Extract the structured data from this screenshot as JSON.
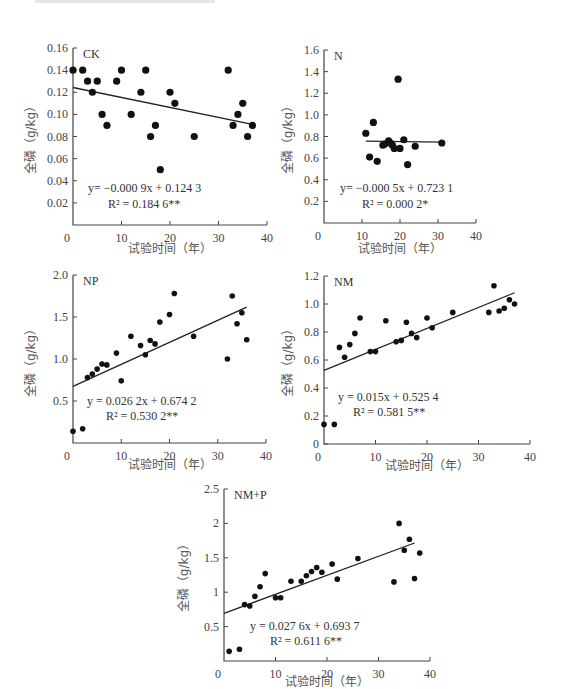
{
  "chart_data": [
    {
      "type": "scatter",
      "panel": "CK",
      "xlabel": "试验时间（年）",
      "ylabel": "全磷（g/kg）",
      "xlim": [
        0,
        40
      ],
      "ylim": [
        0,
        0.16
      ],
      "xticks": [
        0,
        10,
        20,
        30,
        40
      ],
      "yticks": [
        0.02,
        0.04,
        0.06,
        0.08,
        0.1,
        0.12,
        0.14,
        0.16
      ],
      "ytick_labels": [
        "0.02",
        "0.04",
        "0.06",
        "0.08",
        "0.10",
        "0.12",
        "0.14",
        "0.16"
      ],
      "x": [
        0,
        2,
        3,
        4,
        5,
        6,
        7,
        9,
        10,
        12,
        14,
        15,
        16,
        17,
        18,
        20,
        21,
        25,
        32,
        33,
        34,
        35,
        36,
        37
      ],
      "y": [
        0.14,
        0.14,
        0.13,
        0.12,
        0.13,
        0.1,
        0.09,
        0.13,
        0.14,
        0.1,
        0.12,
        0.14,
        0.08,
        0.09,
        0.05,
        0.12,
        0.11,
        0.08,
        0.14,
        0.09,
        0.1,
        0.11,
        0.08,
        0.09
      ],
      "fit": {
        "slope": -0.0009,
        "intercept": 0.1243,
        "x_range": [
          0,
          37
        ]
      },
      "equation": "y= −0.000 9x + 0.124 3",
      "r2": "R² = 0.184 6**"
    },
    {
      "type": "scatter",
      "panel": "N",
      "xlabel": "试验时间（年）",
      "ylabel": "全磷（g/kg）",
      "xlim": [
        0,
        40
      ],
      "ylim": [
        0,
        1.6
      ],
      "xticks": [
        0,
        10,
        20,
        30,
        40
      ],
      "yticks": [
        0.2,
        0.4,
        0.6,
        0.8,
        1.0,
        1.2,
        1.4,
        1.6
      ],
      "ytick_labels": [
        "0.2",
        "0.4",
        "0.6",
        "0.8",
        "1.0",
        "1.2",
        "1.4",
        "1.6"
      ],
      "x": [
        11,
        12,
        13,
        14,
        15.5,
        16,
        17,
        17.5,
        18,
        18.5,
        19.5,
        20,
        21,
        22,
        24,
        31
      ],
      "y": [
        0.83,
        0.61,
        0.93,
        0.57,
        0.72,
        0.73,
        0.76,
        0.74,
        0.72,
        0.69,
        1.33,
        0.69,
        0.77,
        0.54,
        0.71,
        0.74
      ],
      "fit": {
        "slope": -0.0005,
        "intercept": 0.7631,
        "x_range": [
          11,
          31
        ]
      },
      "equation": "y= −0.000 5x + 0.723 1",
      "r2": "R² = 0.000 2*"
    },
    {
      "type": "scatter",
      "panel": "NP",
      "xlabel": "试验时间（年）",
      "ylabel": "全磷（g/kg）",
      "xlim": [
        0,
        40
      ],
      "ylim": [
        0,
        2.0
      ],
      "xticks": [
        0,
        10,
        20,
        30,
        40
      ],
      "yticks": [
        0.5,
        1.0,
        1.5,
        2.0
      ],
      "ytick_labels": [
        "0.5",
        "1.0",
        "1.5",
        "2.0"
      ],
      "x": [
        0,
        2,
        3,
        4,
        5,
        6,
        7,
        9,
        10,
        12,
        14,
        15,
        16,
        17,
        18,
        20,
        21,
        25,
        32,
        33,
        34,
        35,
        36
      ],
      "y": [
        0.14,
        0.17,
        0.78,
        0.82,
        0.88,
        0.94,
        0.93,
        1.07,
        0.74,
        1.27,
        1.16,
        1.05,
        1.22,
        1.18,
        1.44,
        1.53,
        1.78,
        1.27,
        1.0,
        1.75,
        1.42,
        1.55,
        1.23
      ],
      "fit": {
        "slope": 0.0262,
        "intercept": 0.6742,
        "x_range": [
          0,
          36
        ]
      },
      "equation": "y = 0.026 2x + 0.674 2",
      "r2": "R² = 0.530 2**"
    },
    {
      "type": "scatter",
      "panel": "NM",
      "xlabel": "试验时间（年）",
      "ylabel": "全磷（g/kg）",
      "xlim": [
        0,
        40
      ],
      "ylim": [
        0,
        1.2
      ],
      "xticks": [
        0,
        10,
        20,
        30,
        40
      ],
      "yticks": [
        0,
        0.2,
        0.4,
        0.6,
        0.8,
        1.0,
        1.2
      ],
      "ytick_labels": [
        "0",
        "0.2",
        "0.4",
        "0.6",
        "0.8",
        "1.0",
        "1.2"
      ],
      "x": [
        0,
        2,
        3,
        4,
        5,
        6,
        7,
        9,
        10,
        12,
        14,
        15,
        16,
        17,
        18,
        20,
        21,
        25,
        32,
        33,
        34,
        35,
        36,
        37
      ],
      "y": [
        0.14,
        0.14,
        0.69,
        0.62,
        0.71,
        0.79,
        0.9,
        0.66,
        0.66,
        0.88,
        0.73,
        0.74,
        0.87,
        0.79,
        0.76,
        0.9,
        0.83,
        0.94,
        0.94,
        1.13,
        0.95,
        0.97,
        1.03,
        1.0
      ],
      "fit": {
        "slope": 0.015,
        "intercept": 0.5254,
        "x_range": [
          0,
          37
        ]
      },
      "equation": "y = 0.015x + 0.525 4",
      "r2": "R² = 0.581 5**"
    },
    {
      "type": "scatter",
      "panel": "NM+P",
      "xlabel": "试验时间（年）",
      "ylabel": "全磷（g/kg）",
      "xlim": [
        0,
        40
      ],
      "ylim": [
        0,
        2.5
      ],
      "xticks": [
        0,
        10,
        20,
        30,
        40
      ],
      "yticks": [
        0.5,
        1,
        1.5,
        2,
        2.5
      ],
      "ytick_labels": [
        "0.5",
        "1",
        "1.5",
        "2",
        "2.5"
      ],
      "x": [
        1,
        3,
        4,
        5,
        6,
        7,
        8,
        10,
        11,
        13,
        15,
        16,
        17,
        18,
        19,
        21,
        22,
        26,
        33,
        34,
        35,
        36,
        37,
        38
      ],
      "y": [
        0.14,
        0.17,
        0.82,
        0.8,
        0.94,
        1.08,
        1.27,
        0.92,
        0.92,
        1.16,
        1.16,
        1.24,
        1.3,
        1.36,
        1.29,
        1.41,
        1.19,
        1.49,
        1.15,
        2.0,
        1.61,
        1.77,
        1.2,
        1.57
      ],
      "fit": {
        "slope": 0.0276,
        "intercept": 0.6937,
        "x_range": [
          0,
          37
        ]
      },
      "equation": "y = 0.027 6x + 0.693 7",
      "r2": "R² = 0.611 6**"
    }
  ],
  "layout": {
    "panels": [
      {
        "x0": 73,
        "xEnd": 267,
        "yTop": 48,
        "yBase": 225,
        "eqX": 88,
        "eqY": 192,
        "r2X": 108,
        "r2Y": 208,
        "ylabelX": 35,
        "ylabelY": 137,
        "xlabelX": 170,
        "xlabelY": 253
      },
      {
        "x0": 324,
        "xEnd": 476,
        "yTop": 50,
        "yBase": 223,
        "eqX": 340,
        "eqY": 192,
        "r2X": 362,
        "r2Y": 208,
        "ylabelX": 292,
        "ylabelY": 137,
        "xlabelX": 400,
        "xlabelY": 253
      },
      {
        "x0": 73,
        "xEnd": 266,
        "yTop": 275,
        "yBase": 443,
        "eqX": 87,
        "eqY": 405,
        "r2X": 106,
        "r2Y": 420,
        "ylabelX": 35,
        "ylabelY": 360,
        "xlabelX": 170,
        "xlabelY": 469
      },
      {
        "x0": 324,
        "xEnd": 530,
        "yTop": 276,
        "yBase": 444,
        "eqX": 338,
        "eqY": 401,
        "r2X": 353,
        "r2Y": 416,
        "ylabelX": 292,
        "ylabelY": 360,
        "xlabelX": 427,
        "xlabelY": 470
      },
      {
        "x0": 224,
        "xEnd": 430,
        "yTop": 489,
        "yBase": 661,
        "eqX": 250,
        "eqY": 630,
        "r2X": 270,
        "r2Y": 645,
        "ylabelX": 188,
        "ylabelY": 575,
        "xlabelX": 327,
        "xlabelY": 686
      }
    ]
  }
}
